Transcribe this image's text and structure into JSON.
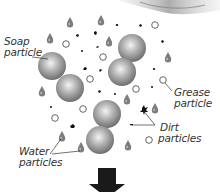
{
  "diagram": {
    "labels": {
      "soap_line1": "Soap",
      "soap_line2": "particle",
      "grease_line1": "Grease",
      "grease_line2": "particle",
      "dirt_line1": "Dirt",
      "dirt_line2": "particles",
      "water_line1": "Water",
      "water_line2": "particles"
    },
    "legend": [
      {
        "name": "Soap particle",
        "shape": "grey-dumbbell"
      },
      {
        "name": "Grease particle",
        "shape": "hollow-circle"
      },
      {
        "name": "Dirt particles",
        "shape": "black-speck"
      },
      {
        "name": "Water particles",
        "shape": "grey-droplet"
      }
    ],
    "colors": {
      "soap": "#8a8a8a",
      "water": "#7a7a7a",
      "dirt": "#111111",
      "grease_stroke": "#555555",
      "arrow": "#1a1a1a",
      "label": "#333333"
    },
    "arrow_direction": "down"
  }
}
